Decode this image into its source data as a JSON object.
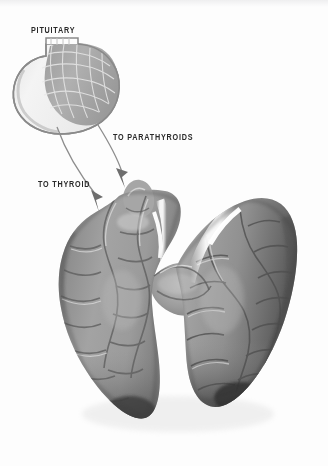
{
  "figure": {
    "kind": "anatomical-illustration",
    "background_color": "#fdfdfd",
    "style": "grayscale halftone medical illustration",
    "width": 328,
    "height": 466
  },
  "labels": {
    "pituitary": "PITUITARY",
    "to_parathyroids": "TO PARATHYROIDS",
    "to_thyroid": "TO THYROID"
  },
  "annotations": {
    "arrow_to_thyroid": {
      "from": "pituitary anterior lobe",
      "to": "left thyroid lobe",
      "head": "solid triangular arrowhead pointing down"
    },
    "arrow_to_parathyroids": {
      "from": "pituitary posterior lobe",
      "to": "thyroid upper pole",
      "head": "solid triangular arrowhead pointing down"
    }
  },
  "structures": {
    "pituitary": {
      "name": "pituitary gland",
      "anterior_lobe_tone": "#f1f1f1",
      "posterior_lobe_tone": "#a9a9a9",
      "outline_color": "#8e8e8e",
      "texture": "reticular cell mesh with light lines"
    },
    "thyroid": {
      "name": "thyroid gland",
      "shape": "butterfly / two lobes joined by isthmus",
      "base_tone": "#9a9a9a",
      "shadow_tone": "#4a4a4a",
      "highlight_tone": "#f7f7f7",
      "texture": "lobulated surface with sinuous grooves"
    }
  },
  "palette": {
    "ink": "#2a2a2a",
    "outline": "#8e8e8e",
    "arrow": "#7d7d7d",
    "mid_gray": "#9a9a9a",
    "dark_gray": "#4a4a4a",
    "light_gray": "#f1f1f1",
    "white": "#ffffff"
  }
}
